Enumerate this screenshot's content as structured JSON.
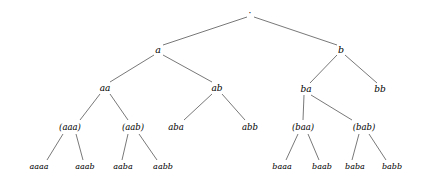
{
  "figure": {
    "kind": "binary-tree-diagram",
    "width": 423,
    "height": 181,
    "background_color": "#ffffff",
    "edge_color": "#555555",
    "text_color": "#000000"
  },
  "nodes": [
    {
      "id": "root",
      "label": "·",
      "x": 250,
      "y": 13,
      "level": 0
    },
    {
      "id": "a",
      "label": "a",
      "x": 158,
      "y": 50,
      "level": 1
    },
    {
      "id": "b",
      "label": "b",
      "x": 341,
      "y": 50,
      "level": 1
    },
    {
      "id": "aa",
      "label": "aa",
      "x": 105,
      "y": 88,
      "level": 2
    },
    {
      "id": "ab",
      "label": "ab",
      "x": 217,
      "y": 88,
      "level": 2
    },
    {
      "id": "ba",
      "label": "ba",
      "x": 306,
      "y": 89,
      "level": 2
    },
    {
      "id": "bb",
      "label": "bb",
      "x": 380,
      "y": 89,
      "level": 2
    },
    {
      "id": "aaa",
      "label": "(aaa)",
      "x": 70,
      "y": 127,
      "level": 3
    },
    {
      "id": "aab",
      "label": "(aab)",
      "x": 133,
      "y": 127,
      "level": 3
    },
    {
      "id": "aba",
      "label": "aba",
      "x": 176,
      "y": 127,
      "level": 3
    },
    {
      "id": "abb",
      "label": "abb",
      "x": 250,
      "y": 127,
      "level": 3
    },
    {
      "id": "baa",
      "label": "(baa)",
      "x": 303,
      "y": 127,
      "level": 3
    },
    {
      "id": "bab",
      "label": "(bab)",
      "x": 364,
      "y": 127,
      "level": 3
    },
    {
      "id": "aaaa",
      "label": "aaaa",
      "x": 39,
      "y": 167,
      "level": 4
    },
    {
      "id": "aaab",
      "label": "aaab",
      "x": 85,
      "y": 167,
      "level": 4
    },
    {
      "id": "aaba",
      "label": "aaba",
      "x": 123,
      "y": 167,
      "level": 4
    },
    {
      "id": "aabb",
      "label": "aabb",
      "x": 163,
      "y": 167,
      "level": 4
    },
    {
      "id": "baaa",
      "label": "baaa",
      "x": 282,
      "y": 167,
      "level": 4
    },
    {
      "id": "baab",
      "label": "baab",
      "x": 322,
      "y": 167,
      "level": 4
    },
    {
      "id": "baba",
      "label": "baba",
      "x": 355,
      "y": 167,
      "level": 4
    },
    {
      "id": "babb",
      "label": "babb",
      "x": 392,
      "y": 167,
      "level": 4
    }
  ],
  "edges": [
    {
      "from": "root",
      "to": "a",
      "x1": 247,
      "y1": 17,
      "x2": 163,
      "y2": 45
    },
    {
      "from": "root",
      "to": "b",
      "x1": 254,
      "y1": 17,
      "x2": 337,
      "y2": 45
    },
    {
      "from": "a",
      "to": "aa",
      "x1": 154,
      "y1": 55,
      "x2": 110,
      "y2": 82
    },
    {
      "from": "a",
      "to": "ab",
      "x1": 163,
      "y1": 55,
      "x2": 212,
      "y2": 82
    },
    {
      "from": "b",
      "to": "ba",
      "x1": 337,
      "y1": 55,
      "x2": 310,
      "y2": 83
    },
    {
      "from": "b",
      "to": "bb",
      "x1": 345,
      "y1": 55,
      "x2": 377,
      "y2": 83
    },
    {
      "from": "aa",
      "to": "aaa",
      "x1": 100,
      "y1": 94,
      "x2": 80,
      "y2": 120
    },
    {
      "from": "aa",
      "to": "aab",
      "x1": 110,
      "y1": 94,
      "x2": 128,
      "y2": 120
    },
    {
      "from": "ab",
      "to": "aba",
      "x1": 212,
      "y1": 94,
      "x2": 184,
      "y2": 120
    },
    {
      "from": "ab",
      "to": "abb",
      "x1": 222,
      "y1": 94,
      "x2": 245,
      "y2": 120
    },
    {
      "from": "ba",
      "to": "baa",
      "x1": 304,
      "y1": 95,
      "x2": 303,
      "y2": 120
    },
    {
      "from": "ba",
      "to": "bab",
      "x1": 311,
      "y1": 95,
      "x2": 352,
      "y2": 120
    },
    {
      "from": "aaa",
      "to": "aaaa",
      "x1": 63,
      "y1": 134,
      "x2": 47,
      "y2": 160
    },
    {
      "from": "aaa",
      "to": "aaab",
      "x1": 76,
      "y1": 134,
      "x2": 83,
      "y2": 160
    },
    {
      "from": "aab",
      "to": "aaba",
      "x1": 128,
      "y1": 134,
      "x2": 122,
      "y2": 160
    },
    {
      "from": "aab",
      "to": "aabb",
      "x1": 139,
      "y1": 134,
      "x2": 157,
      "y2": 160
    },
    {
      "from": "baa",
      "to": "baaa",
      "x1": 298,
      "y1": 134,
      "x2": 286,
      "y2": 160
    },
    {
      "from": "baa",
      "to": "baab",
      "x1": 308,
      "y1": 134,
      "x2": 319,
      "y2": 160
    },
    {
      "from": "bab",
      "to": "baba",
      "x1": 359,
      "y1": 134,
      "x2": 352,
      "y2": 160
    },
    {
      "from": "bab",
      "to": "babb",
      "x1": 369,
      "y1": 134,
      "x2": 386,
      "y2": 160
    }
  ]
}
